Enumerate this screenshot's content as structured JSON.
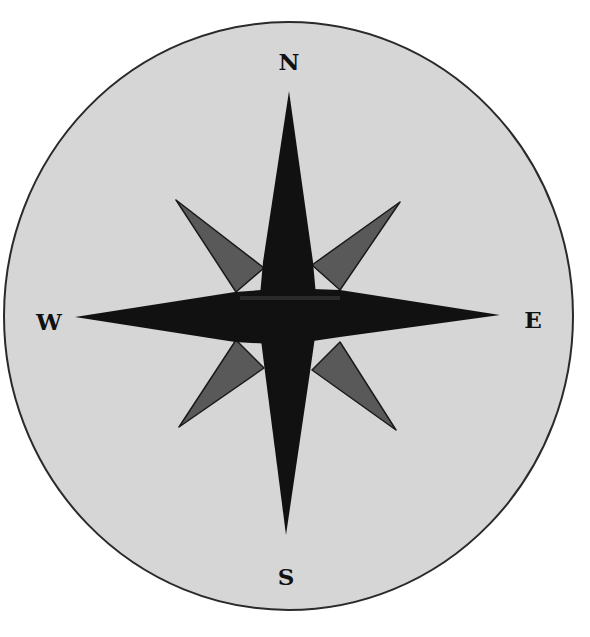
{
  "diagram": {
    "type": "compass-rose",
    "colors": {
      "page_background": "#ffffff",
      "disc_fill": "#d6d6d6",
      "disc_stroke": "#2a2a2a",
      "cardinal_points": "#111111",
      "intercardinal_points": "#595959",
      "label": "#111111"
    },
    "labels": {
      "north": "N",
      "east": "E",
      "south": "S",
      "west": "W"
    }
  }
}
